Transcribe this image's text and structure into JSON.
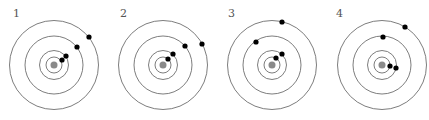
{
  "figure": {
    "colors": {
      "orbit": "#6e6e6e",
      "sun": "#8a8a8a",
      "planet": "#000000",
      "label": "#555555"
    },
    "orbit_radii": [
      8,
      14.5,
      29,
      44.5
    ],
    "sun_radius": 3.5,
    "planet_radius": 2.6,
    "panels": [
      {
        "label": "1",
        "label_pos": [
          13,
          17
        ],
        "center": [
          54,
          65
        ],
        "planets": [
          [
            62,
            60
          ],
          [
            66,
            56
          ],
          [
            77,
            47
          ],
          [
            89,
            37
          ]
        ]
      },
      {
        "label": "2",
        "label_pos": [
          120,
          17
        ],
        "center": [
          163,
          65
        ],
        "planets": [
          [
            168,
            59
          ],
          [
            173,
            54
          ],
          [
            185,
            46
          ],
          [
            202,
            44
          ]
        ]
      },
      {
        "label": "3",
        "label_pos": [
          228,
          17
        ],
        "center": [
          272,
          65
        ],
        "planets": [
          [
            276,
            58
          ],
          [
            282,
            54
          ],
          [
            256,
            42
          ],
          [
            282,
            22
          ]
        ]
      },
      {
        "label": "4",
        "label_pos": [
          336,
          17
        ],
        "center": [
          382,
          65
        ],
        "planets": [
          [
            390,
            66
          ],
          [
            396,
            68
          ],
          [
            383,
            37
          ],
          [
            405,
            27
          ]
        ]
      }
    ]
  }
}
